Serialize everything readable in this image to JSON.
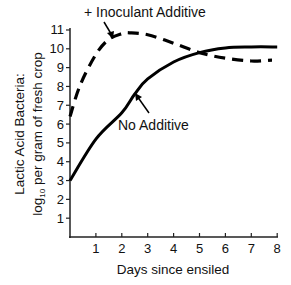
{
  "chart_data": {
    "type": "line",
    "title": "",
    "xlabel": "Days since ensiled",
    "ylabel_line1": "Lactic Acid Bacteria:",
    "ylabel_line2": "log",
    "ylabel_sub": "10",
    "ylabel_line2_rest": " per gram of fresh crop",
    "xlim": [
      0,
      8
    ],
    "ylim": [
      0,
      11
    ],
    "x_ticks": [
      "1",
      "2",
      "3",
      "4",
      "5",
      "6",
      "7",
      "8"
    ],
    "y_ticks": [
      "1",
      "2",
      "3",
      "4",
      "5",
      "6",
      "7",
      "8",
      "9",
      "10",
      "11"
    ],
    "grid": false,
    "legend": "none (inline annotations with arrows)",
    "series": [
      {
        "name": "+ Inoculant Additive",
        "style": "dashed",
        "x": [
          0,
          0.4,
          1.0,
          1.5,
          2.0,
          2.3,
          3.0,
          4.0,
          5.0,
          6.0,
          7.0,
          7.8
        ],
        "values": [
          6.4,
          8.1,
          9.7,
          10.5,
          10.8,
          10.85,
          10.75,
          10.3,
          9.8,
          9.5,
          9.35,
          9.4
        ]
      },
      {
        "name": "No Additive",
        "style": "solid",
        "x": [
          0,
          1,
          2,
          2.5,
          3,
          4,
          5,
          6,
          7,
          8
        ],
        "values": [
          3.0,
          5.2,
          6.6,
          7.6,
          8.4,
          9.3,
          9.8,
          10.05,
          10.1,
          10.1
        ]
      }
    ],
    "annotations": [
      {
        "text": "+ Inoculant Additive",
        "points_to": "dashed curve near day 1.6"
      },
      {
        "text": "No Additive",
        "points_to": "solid curve near day 2.5"
      }
    ]
  },
  "labels": {
    "inoculant": "+ Inoculant Additive",
    "no_additive": "No Additive"
  }
}
